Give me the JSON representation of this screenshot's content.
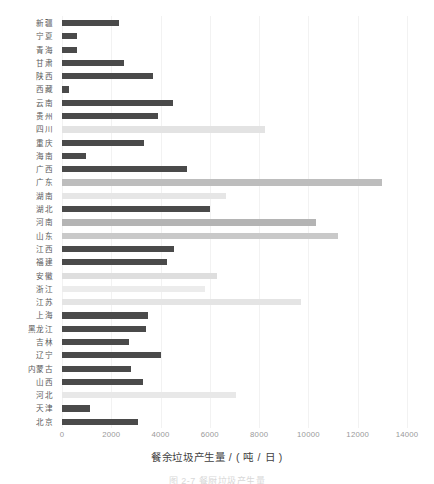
{
  "chart_data": {
    "type": "bar",
    "orientation": "horizontal",
    "title": "",
    "xlabel": "餐余垃圾产生量 / ( 吨 / 日 )",
    "ylabel": "",
    "xlim": [
      0,
      14000
    ],
    "ylim": null,
    "grid": "vertical",
    "legend": null,
    "xticks": [
      0,
      2000,
      4000,
      6000,
      8000,
      10000,
      12000,
      14000
    ],
    "xtick_labels": [
      "0",
      "2000",
      "4000",
      "6000",
      "8000",
      "10000",
      "12000",
      "14000"
    ],
    "categories": [
      "新疆",
      "宁夏",
      "青海",
      "甘肃",
      "陕西",
      "西藏",
      "云南",
      "贵州",
      "四川",
      "重庆",
      "海南",
      "广西",
      "广东",
      "湖南",
      "湖北",
      "河南",
      "山东",
      "江西",
      "福建",
      "安徽",
      "浙江",
      "江苏",
      "上海",
      "黑龙江",
      "吉林",
      "辽宁",
      "内蒙古",
      "山西",
      "河北",
      "天津",
      "北京"
    ],
    "values": [
      2300,
      620,
      600,
      2530,
      3680,
      300,
      4520,
      3880,
      8250,
      3320,
      980,
      5070,
      13000,
      6650,
      6000,
      10300,
      11200,
      4550,
      4250,
      6300,
      5800,
      9700,
      3500,
      3400,
      2700,
      4000,
      2800,
      3300,
      7050,
      1150,
      3100
    ],
    "bar_colors": [
      "#4a4a4a",
      "#4a4a4a",
      "#4a4a4a",
      "#4a4a4a",
      "#4a4a4a",
      "#4a4a4a",
      "#4a4a4a",
      "#4a4a4a",
      "#e3e3e3",
      "#4a4a4a",
      "#4a4a4a",
      "#4a4a4a",
      "#bdbdbd",
      "#e6e6e6",
      "#4a4a4a",
      "#b4b4b4",
      "#c9c9c9",
      "#4a4a4a",
      "#4a4a4a",
      "#dedede",
      "#ececec",
      "#e4e4e4",
      "#4a4a4a",
      "#4a4a4a",
      "#4a4a4a",
      "#4a4a4a",
      "#4a4a4a",
      "#4a4a4a",
      "#e8e8e8",
      "#4a4a4a",
      "#4a4a4a"
    ]
  },
  "axis": {
    "x_title": "餐余垃圾产生量 / ( 吨 / 日 )"
  },
  "caption": {
    "text": "图 2-7  餐厨垃圾产生量"
  },
  "colors": {
    "bar_dark": "#4a4a4a",
    "bar_light": "#e8e8e8",
    "bar_medium": "#bdbdbd",
    "grid": "#f2f2f2",
    "tick_text": "#9a9a9a",
    "label_text": "#5a5a5a",
    "title_text": "#3f3f3f",
    "background": "#ffffff"
  }
}
